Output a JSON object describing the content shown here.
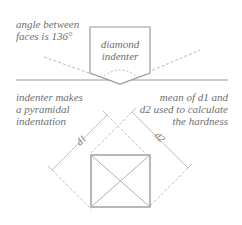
{
  "labels": {
    "angle_note": "angle between\nfaces is 136°",
    "indenter_name": "diamond\nindenter",
    "indentation_note": "indenter makes\na pyramidal\nindentation",
    "hardness_note": "mean of  d1 and\nd2 used to calculate\nthe hardness",
    "d1": "d1",
    "d2": "d2"
  },
  "colors": {
    "line": "#9a9a9a",
    "dashed": "#b8b8b8",
    "text": "#6f6f6f",
    "background": "#ffffff"
  }
}
